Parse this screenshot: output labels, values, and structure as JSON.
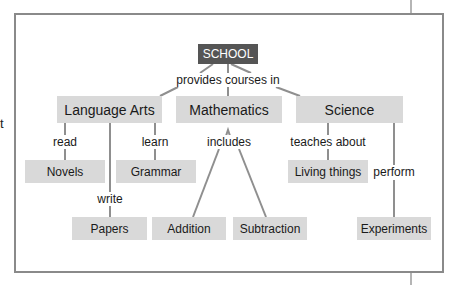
{
  "diagram": {
    "type": "concept-map",
    "side_fragment": "t",
    "root": {
      "label": "SCHOOL"
    },
    "root_link": "provides courses in",
    "subjects": [
      {
        "label": "Language Arts"
      },
      {
        "label": "Mathematics"
      },
      {
        "label": "Science"
      }
    ],
    "links": {
      "read": "read",
      "learn": "learn",
      "write": "write",
      "includes": "includes",
      "teaches_about": "teaches about",
      "perform": "perform"
    },
    "leaves": {
      "novels": "Novels",
      "grammar": "Grammar",
      "papers": "Papers",
      "addition": "Addition",
      "subtraction": "Subtraction",
      "living_things": "Living things",
      "experiments": "Experiments"
    },
    "edges": [
      [
        "SCHOOL",
        "provides courses in",
        "Language Arts"
      ],
      [
        "SCHOOL",
        "provides courses in",
        "Mathematics"
      ],
      [
        "SCHOOL",
        "provides courses in",
        "Science"
      ],
      [
        "Language Arts",
        "read",
        "Novels"
      ],
      [
        "Language Arts",
        "learn",
        "Grammar"
      ],
      [
        "Language Arts",
        "write",
        "Papers"
      ],
      [
        "Mathematics",
        "includes",
        "Addition"
      ],
      [
        "Mathematics",
        "includes",
        "Subtraction"
      ],
      [
        "Science",
        "teaches about",
        "Living things"
      ],
      [
        "Science",
        "perform",
        "Experiments"
      ]
    ],
    "colors": {
      "root_fill": "#555555",
      "node_fill": "#d9d9d9",
      "line": "#8f8f8f",
      "frame": "#8a8a8a"
    }
  }
}
